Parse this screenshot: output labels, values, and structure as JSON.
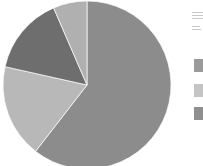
{
  "canvas": {
    "width": 203,
    "height": 166,
    "background": "#ffffff"
  },
  "chart_data": {
    "type": "pie",
    "title": "",
    "subtitle": "",
    "xlabel": "",
    "ylabel": "",
    "grid": false,
    "legend_position": "right",
    "start_angle_deg": 0,
    "direction": "clockwise",
    "center": {
      "x": 87,
      "y": 85
    },
    "radius": 84,
    "categories": [
      "Series 1",
      "Series 2",
      "Series 3",
      "Series 4"
    ],
    "values": [
      60.5,
      18.0,
      15.0,
      6.5
    ],
    "units": "percent",
    "colors": [
      "#8c8c8c",
      "#b8b8b8",
      "#6e6e6e",
      "#b0b0b0"
    ],
    "slices": [
      {
        "label": "Series 1",
        "value": 60.5,
        "color": "#8c8c8c",
        "start_angle_deg": 0,
        "end_angle_deg": 217.8
      },
      {
        "label": "Series 2",
        "value": 18.0,
        "color": "#b8b8b8",
        "start_angle_deg": 217.8,
        "end_angle_deg": 282.6
      },
      {
        "label": "Series 3",
        "value": 15.0,
        "color": "#6e6e6e",
        "start_angle_deg": 282.6,
        "end_angle_deg": 336.6
      },
      {
        "label": "Series 4",
        "value": 6.5,
        "color": "#b0b0b0",
        "start_angle_deg": 336.6,
        "end_angle_deg": 360
      }
    ],
    "annotations": []
  },
  "legend": {
    "clipped": true,
    "title_visible": false,
    "items": [
      {
        "label": "",
        "color": "#9a9a9a",
        "top": 59
      },
      {
        "label": "",
        "color": "#c4c4c4",
        "top": 84
      },
      {
        "label": "",
        "color": "#8f8f8f",
        "top": 107
      }
    ]
  }
}
